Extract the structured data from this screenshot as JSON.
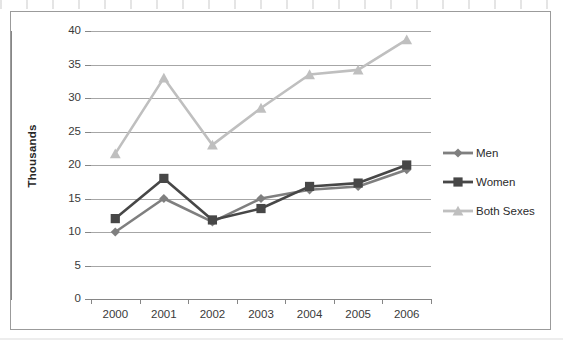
{
  "chart_data": {
    "type": "line",
    "title": "",
    "subtitle": "",
    "xlabel": "",
    "ylabel": "Thousands",
    "categories": [
      "2000",
      "2001",
      "2002",
      "2003",
      "2004",
      "2005",
      "2006"
    ],
    "ylim": [
      0,
      40
    ],
    "ytick_step": 5,
    "yticks": [
      "0",
      "5",
      "10",
      "15",
      "20",
      "25",
      "30",
      "35",
      "40"
    ],
    "grid": "horizontal",
    "legend_position": "right",
    "series": [
      {
        "name": "Men",
        "color": "#7f7f7f",
        "marker": "diamond",
        "values": [
          10.0,
          15.0,
          11.5,
          15.0,
          16.3,
          16.8,
          19.3
        ]
      },
      {
        "name": "Women",
        "color": "#474747",
        "marker": "square",
        "values": [
          12.0,
          18.0,
          11.8,
          13.5,
          16.8,
          17.3,
          20.0
        ]
      },
      {
        "name": "Both Sexes",
        "color": "#bfbfbf",
        "marker": "triangle",
        "values": [
          21.7,
          33.0,
          23.0,
          28.5,
          33.5,
          34.2,
          38.7
        ]
      }
    ]
  },
  "legend": {
    "items": [
      {
        "label": "Men"
      },
      {
        "label": "Women"
      },
      {
        "label": "Both Sexes"
      }
    ]
  },
  "colors": {
    "men": "#7f7f7f",
    "women": "#474747",
    "both_sexes": "#bfbfbf",
    "gridline": "#a6a6a6",
    "axis": "#868686",
    "border": "#9b9b9b",
    "text": "#3a3a3a",
    "background": "#ffffff"
  }
}
